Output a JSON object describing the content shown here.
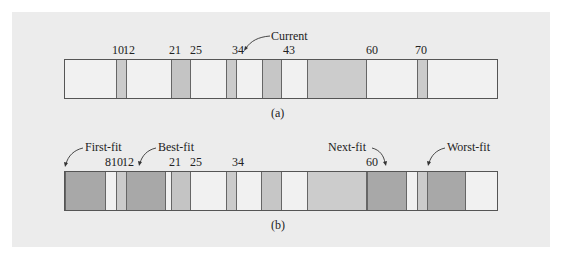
{
  "figure": {
    "background": "#ececec",
    "colors": {
      "free": "#f1f1f1",
      "allocated_light": "#cbcbcb",
      "allocated_medium": "#c2c2c2",
      "new_allocation": "#a8a8a8",
      "border": "#555555"
    },
    "panel_a": {
      "caption": "(a)",
      "pointer_label": "Current",
      "labels": [
        {
          "text": "10",
          "x": 112
        },
        {
          "text": "12",
          "x": 123
        },
        {
          "text": "21",
          "x": 169
        },
        {
          "text": "25",
          "x": 190
        },
        {
          "text": "34",
          "x": 232
        },
        {
          "text": "43",
          "x": 283
        },
        {
          "text": "60",
          "x": 366
        },
        {
          "text": "70",
          "x": 415
        }
      ],
      "segments": [
        {
          "name": "block-10",
          "left": 51,
          "width": 11,
          "color": "#cbcbcb"
        },
        {
          "name": "block-21",
          "left": 106,
          "width": 20,
          "color": "#c4c4c4"
        },
        {
          "name": "block-34",
          "left": 161,
          "width": 11,
          "color": "#cbcbcb"
        },
        {
          "name": "block-43",
          "left": 197,
          "width": 20,
          "color": "#c6c6c6"
        },
        {
          "name": "block-60",
          "left": 242,
          "width": 60,
          "color": "#cccccc"
        },
        {
          "name": "block-70",
          "left": 352,
          "width": 11,
          "color": "#cbcbcb"
        }
      ]
    },
    "panel_b": {
      "caption": "(b)",
      "annotations": [
        "First-fit",
        "Best-fit",
        "Next-fit",
        "Worst-fit"
      ],
      "labels": [
        {
          "text": "8",
          "x": 105
        },
        {
          "text": "10",
          "x": 111
        },
        {
          "text": "12",
          "x": 122
        },
        {
          "text": "21",
          "x": 169
        },
        {
          "text": "25",
          "x": 190
        },
        {
          "text": "34",
          "x": 232
        },
        {
          "text": "60",
          "x": 366
        }
      ],
      "segments": [
        {
          "name": "first-fit-block",
          "left": 0,
          "width": 41,
          "color": "#a8a8a8"
        },
        {
          "name": "block-10",
          "left": 51,
          "width": 11,
          "color": "#cbcbcb"
        },
        {
          "name": "best-fit-block",
          "left": 61,
          "width": 40,
          "color": "#a8a8a8"
        },
        {
          "name": "block-21",
          "left": 106,
          "width": 20,
          "color": "#c4c4c4"
        },
        {
          "name": "block-34",
          "left": 161,
          "width": 11,
          "color": "#cbcbcb"
        },
        {
          "name": "block-43",
          "left": 196,
          "width": 21,
          "color": "#c6c6c6"
        },
        {
          "name": "block-60",
          "left": 242,
          "width": 60,
          "color": "#cccccc"
        },
        {
          "name": "next-fit-block",
          "left": 302,
          "width": 40,
          "color": "#a8a8a8"
        },
        {
          "name": "block-70",
          "left": 352,
          "width": 11,
          "color": "#cbcbcb"
        },
        {
          "name": "worst-fit-block",
          "left": 362,
          "width": 39,
          "color": "#a8a8a8"
        }
      ]
    }
  }
}
